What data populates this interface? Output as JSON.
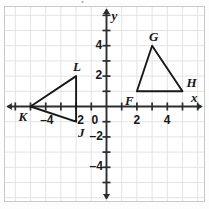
{
  "clipped_header": "▀▀▀ ▀▀ ▀ ▀▀,▀▀",
  "figure": {
    "name": "coordinate-plane-two-triangles",
    "grid_color": "#e3e3e6",
    "axis_color": "#2a2d31",
    "shape_color": "#16181a",
    "border_color": "#c9c9c9"
  },
  "axes": {
    "x_label": "x",
    "y_label": "y",
    "origin_label": "0",
    "x_ticks": [
      {
        "value": -4,
        "label": "–4"
      },
      {
        "value": -2,
        "label": "–2"
      },
      {
        "value": 2,
        "label": "2"
      },
      {
        "value": 4,
        "label": "4"
      }
    ],
    "y_ticks": [
      {
        "value": 4,
        "label": "4"
      },
      {
        "value": 2,
        "label": "2"
      },
      {
        "value": -2,
        "label": "–2"
      },
      {
        "value": -4,
        "label": "–4"
      }
    ],
    "x_range": [
      -6,
      6
    ],
    "y_range": [
      -6,
      6
    ]
  },
  "chart_data": {
    "type": "scatter",
    "title": "",
    "xlabel": "x",
    "ylabel": "y",
    "xlim": [
      -6,
      6
    ],
    "ylim": [
      -6,
      6
    ],
    "grid": true,
    "unit_px": 15.2,
    "series": [
      {
        "name": "Triangle JKL",
        "closed": true,
        "points": [
          {
            "label": "K",
            "x": -5,
            "y": 0,
            "label_pos": "below-left"
          },
          {
            "label": "L",
            "x": -2,
            "y": 2,
            "label_pos": "above"
          },
          {
            "label": "J",
            "x": -2,
            "y": -1,
            "label_pos": "below-right"
          }
        ]
      },
      {
        "name": "Triangle FGH",
        "closed": true,
        "points": [
          {
            "label": "F",
            "x": 2,
            "y": 1,
            "label_pos": "below-left"
          },
          {
            "label": "G",
            "x": 3,
            "y": 4,
            "label_pos": "above"
          },
          {
            "label": "H",
            "x": 5,
            "y": 1,
            "label_pos": "above-right"
          }
        ]
      }
    ]
  },
  "vertex_labels": {
    "K": "K",
    "L": "L",
    "J": "J",
    "F": "F",
    "G": "G",
    "H": "H"
  }
}
